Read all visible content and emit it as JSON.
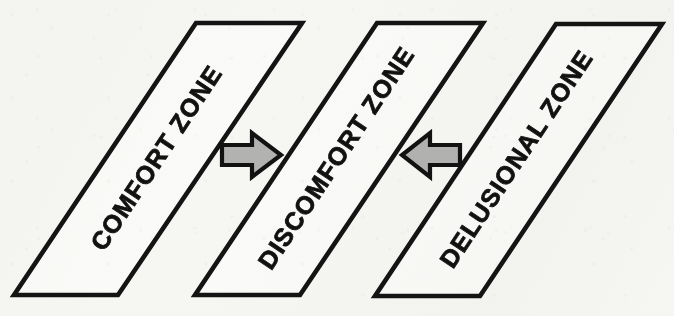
{
  "figure": {
    "kind": "concept-diagram",
    "background_color": "#fafaf8",
    "ink_color": "#141414",
    "arrow_fill_color": "#b6b6b6",
    "label_angle_degrees": -56.4
  },
  "zones": [
    {
      "id": "comfort",
      "label": "COMFORT ZONE",
      "order": 1
    },
    {
      "id": "discomfort",
      "label": "DISCOMFORT ZONE",
      "order": 2
    },
    {
      "id": "delusional",
      "label": "DELUSIONAL ZONE",
      "order": 3
    }
  ],
  "arrows": [
    {
      "id": "arrow-comfort-to-discomfort",
      "direction": "right",
      "glyph": "→",
      "from": "COMFORT ZONE",
      "to": "DISCOMFORT ZONE"
    },
    {
      "id": "arrow-delusional-to-discomfort",
      "direction": "left",
      "glyph": "←",
      "from": "DELUSIONAL ZONE",
      "to": "DISCOMFORT ZONE"
    }
  ]
}
